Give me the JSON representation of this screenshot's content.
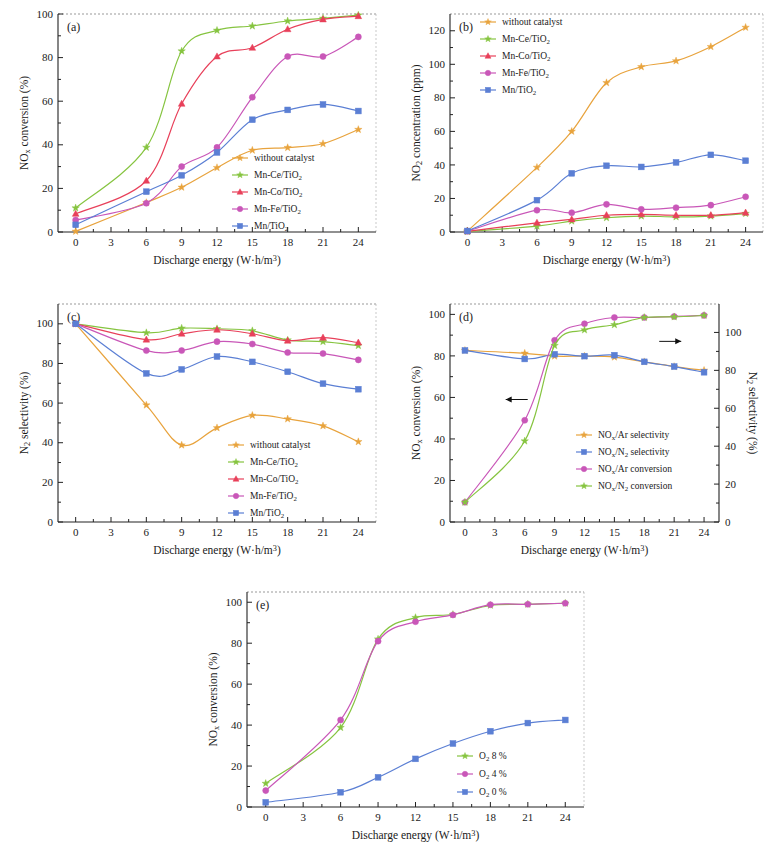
{
  "figure": {
    "x_axis_label": "Discharge energy (W·h/m³)",
    "x_ticks": [
      0,
      3,
      6,
      9,
      12,
      15,
      18,
      21,
      24
    ],
    "colors": {
      "without_catalyst": "#E8A33D",
      "mn_ce_tio2": "#86C440",
      "mn_co_tio2": "#E8405A",
      "mn_fe_tio2": "#C957B8",
      "mn_tio2": "#5B7FD4",
      "nox_ar_selectivity": "#E8A33D",
      "nox_n2_selectivity": "#5B7FD4",
      "nox_ar_conversion": "#C957B8",
      "nox_n2_conversion": "#86C440",
      "o2_8": "#86C440",
      "o2_4": "#C957B8",
      "o2_0": "#5B7FD4"
    }
  },
  "chart_data": [
    {
      "panel": "(a)",
      "type": "line",
      "title": "",
      "xlabel": "Discharge energy (W·h/m³)",
      "ylabel": "NOx conversion (%)",
      "ylabel_main": "NO",
      "ylabel_sub": "x",
      "ylabel_rest": " conversion (%)",
      "xlim": [
        -1.5,
        25.5
      ],
      "ylim": [
        0,
        100
      ],
      "y_ticks": [
        0,
        20,
        40,
        60,
        80,
        100
      ],
      "x": [
        0,
        6,
        9,
        12,
        15,
        18,
        21,
        24
      ],
      "grid": false,
      "legend_position": "bottom-right",
      "series": [
        {
          "name": "without catalyst",
          "color_key": "without_catalyst",
          "marker": "star",
          "values": [
            0.3,
            13.5,
            20.5,
            29.5,
            37.5,
            38.7,
            40.5,
            47.0
          ]
        },
        {
          "name": "Mn-Ce/TiO2",
          "label_main": "Mn-Ce/TiO",
          "label_sub": "2",
          "color_key": "mn_ce_tio2",
          "marker": "star",
          "values": [
            11.0,
            38.8,
            83.0,
            92.5,
            94.5,
            96.8,
            98.0,
            99.5
          ]
        },
        {
          "name": "Mn-Co/TiO2",
          "label_main": "Mn-Co/TiO",
          "label_sub": "2",
          "color_key": "mn_co_tio2",
          "marker": "triangle",
          "values": [
            8.3,
            23.5,
            58.8,
            80.5,
            84.5,
            93.0,
            97.5,
            99.0
          ]
        },
        {
          "name": "Mn-Fe/TiO2",
          "label_main": "Mn-Fe/TiO",
          "label_sub": "2",
          "color_key": "mn_fe_tio2",
          "marker": "circle",
          "values": [
            5.5,
            13.2,
            30.0,
            38.8,
            61.8,
            80.5,
            80.5,
            89.5
          ]
        },
        {
          "name": "Mn/TiO2",
          "label_main": "Mn/TiO",
          "label_sub": "2",
          "color_key": "mn_tio2",
          "marker": "square",
          "values": [
            3.3,
            18.5,
            26.0,
            36.5,
            51.5,
            56.0,
            58.5,
            55.5
          ]
        }
      ]
    },
    {
      "panel": "(b)",
      "type": "line",
      "title": "",
      "xlabel": "Discharge energy (W·h/m³)",
      "ylabel": "NO2 concentration (ppm)",
      "ylabel_main": "NO",
      "ylabel_sub": "2",
      "ylabel_rest": " concentration (ppm)",
      "xlim": [
        -1.5,
        25.5
      ],
      "ylim": [
        0,
        130
      ],
      "y_ticks": [
        0,
        20,
        40,
        60,
        80,
        100,
        120
      ],
      "x": [
        0,
        6,
        9,
        12,
        15,
        18,
        21,
        24
      ],
      "grid": false,
      "legend_position": "top-left",
      "series": [
        {
          "name": "without catalyst",
          "color_key": "without_catalyst",
          "marker": "star",
          "values": [
            0.5,
            38.5,
            60.0,
            89.0,
            98.5,
            102.0,
            110.5,
            122.0
          ]
        },
        {
          "name": "Mn-Ce/TiO2",
          "label_main": "Mn-Ce/TiO",
          "label_sub": "2",
          "color_key": "mn_ce_tio2",
          "marker": "star",
          "values": [
            0.3,
            3.5,
            6.5,
            8.5,
            9.5,
            9.0,
            9.5,
            11.0
          ]
        },
        {
          "name": "Mn-Co/TiO2",
          "label_main": "Mn-Co/TiO",
          "label_sub": "2",
          "color_key": "mn_co_tio2",
          "marker": "triangle",
          "values": [
            0.4,
            5.5,
            7.5,
            10.0,
            10.5,
            10.0,
            10.0,
            11.5
          ]
        },
        {
          "name": "Mn-Fe/TiO2",
          "label_main": "Mn-Fe/TiO",
          "label_sub": "2",
          "color_key": "mn_fe_tio2",
          "marker": "circle",
          "values": [
            0.5,
            13.0,
            11.5,
            16.5,
            13.5,
            14.5,
            16.0,
            21.0
          ]
        },
        {
          "name": "Mn/TiO2",
          "label_main": "Mn/TiO",
          "label_sub": "2",
          "color_key": "mn_tio2",
          "marker": "square",
          "values": [
            0.6,
            19.0,
            35.0,
            39.5,
            38.8,
            41.5,
            46.0,
            42.5
          ]
        }
      ]
    },
    {
      "panel": "(c)",
      "type": "line",
      "title": "",
      "xlabel": "Discharge energy (W·h/m³)",
      "ylabel": "N2 selectivity (%)",
      "ylabel_main": "N",
      "ylabel_sub": "2",
      "ylabel_rest": " selectivity (%)",
      "xlim": [
        -1.5,
        25.5
      ],
      "ylim": [
        0,
        110
      ],
      "y_ticks": [
        0,
        20,
        40,
        60,
        80,
        100
      ],
      "x": [
        0,
        6,
        9,
        12,
        15,
        18,
        21,
        24
      ],
      "grid": false,
      "legend_position": "bottom-right",
      "series": [
        {
          "name": "without catalyst",
          "color_key": "without_catalyst",
          "marker": "star",
          "values": [
            100.0,
            59.0,
            38.8,
            47.5,
            53.8,
            52.0,
            48.5,
            40.5
          ]
        },
        {
          "name": "Mn-Ce/TiO2",
          "label_main": "Mn-Ce/TiO",
          "label_sub": "2",
          "color_key": "mn_ce_tio2",
          "marker": "star",
          "values": [
            100.0,
            95.5,
            97.8,
            97.5,
            96.5,
            91.8,
            91.0,
            89.0
          ]
        },
        {
          "name": "Mn-Co/TiO2",
          "label_main": "Mn-Co/TiO",
          "label_sub": "2",
          "color_key": "mn_co_tio2",
          "marker": "triangle",
          "values": [
            100.0,
            92.0,
            95.0,
            97.0,
            95.0,
            91.5,
            93.0,
            90.5
          ]
        },
        {
          "name": "Mn-Fe/TiO2",
          "label_main": "Mn-Fe/TiO",
          "label_sub": "2",
          "color_key": "mn_fe_tio2",
          "marker": "circle",
          "values": [
            100.0,
            86.5,
            86.5,
            91.0,
            89.8,
            85.5,
            85.0,
            81.8
          ]
        },
        {
          "name": "Mn/TiO2",
          "label_main": "Mn/TiO",
          "label_sub": "2",
          "color_key": "mn_tio2",
          "marker": "square",
          "values": [
            100.0,
            75.0,
            77.0,
            83.5,
            80.8,
            75.8,
            69.8,
            67.0
          ]
        }
      ]
    },
    {
      "panel": "(d)",
      "type": "line",
      "title": "",
      "xlabel": "Discharge energy (W·h/m³)",
      "ylabel": "NOx conversion (%)",
      "ylabel_main": "NO",
      "ylabel_sub": "x",
      "ylabel_rest": " conversion (%)",
      "ylabel_right": "N2 selectivity (%)",
      "ylabel_right_main": "N",
      "ylabel_right_sub": "2",
      "ylabel_right_rest": " selectivity (%)",
      "xlim": [
        -1.5,
        25.5
      ],
      "ylim": [
        0,
        105
      ],
      "ylim_right": [
        0,
        115
      ],
      "y_ticks": [
        0,
        20,
        40,
        60,
        80,
        100
      ],
      "y_ticks_right": [
        0,
        20,
        40,
        60,
        80,
        100
      ],
      "x": [
        0,
        6,
        9,
        12,
        15,
        18,
        21,
        24
      ],
      "grid": false,
      "legend_position": "center-right",
      "annotations": [
        {
          "name": "left-arrow",
          "x": 6.3,
          "y": 59,
          "direction": "left"
        },
        {
          "name": "right-arrow",
          "x": 19.5,
          "y": 87,
          "direction": "right"
        }
      ],
      "series": [
        {
          "name": "NOx/Ar selectivity",
          "label_main": "NO",
          "label_sub": "x",
          "label_rest": "/Ar selectivity",
          "color_key": "nox_ar_selectivity",
          "marker": "star",
          "axis": "right",
          "values": [
            90.5,
            89.0,
            87.5,
            87.5,
            87.0,
            84.5,
            82.0,
            80.0
          ]
        },
        {
          "name": "NOx/N2 selectivity",
          "label_main": "NO",
          "label_sub": "x",
          "label_rest": "/N",
          "label_sub2": "2",
          "label_rest2": " selectivity",
          "color_key": "nox_n2_selectivity",
          "marker": "square",
          "axis": "right",
          "values": [
            90.5,
            86.0,
            88.5,
            87.5,
            88.0,
            84.5,
            82.0,
            79.0
          ]
        },
        {
          "name": "NOx/Ar conversion",
          "label_main": "NO",
          "label_sub": "x",
          "label_rest": "/Ar conversion",
          "color_key": "nox_ar_conversion",
          "marker": "circle",
          "axis": "left",
          "values": [
            9.5,
            49.0,
            87.5,
            95.5,
            98.5,
            98.5,
            99.0,
            99.5
          ]
        },
        {
          "name": "NOx/N2 conversion",
          "label_main": "NO",
          "label_sub": "x",
          "label_rest": "/N",
          "label_sub2": "2",
          "label_rest2": " conversion",
          "color_key": "nox_n2_conversion",
          "marker": "star",
          "axis": "left",
          "values": [
            9.5,
            39.0,
            85.0,
            92.5,
            95.0,
            98.5,
            98.8,
            99.5
          ]
        }
      ]
    },
    {
      "panel": "(e)",
      "type": "line",
      "title": "",
      "xlabel": "Discharge energy (W·h/m³)",
      "ylabel": "NOx conversion (%)",
      "ylabel_main": "NO",
      "ylabel_sub": "x",
      "ylabel_rest": " conversion (%)",
      "xlim": [
        -1.5,
        25.5
      ],
      "ylim": [
        0,
        105
      ],
      "y_ticks": [
        0,
        20,
        40,
        60,
        80,
        100
      ],
      "x": [
        0,
        6,
        9,
        12,
        15,
        18,
        21,
        24
      ],
      "grid": false,
      "legend_position": "bottom-right",
      "series": [
        {
          "name": "O2 8 %",
          "label_main": "O",
          "label_sub": "2",
          "label_rest": " 8 %",
          "color_key": "o2_8",
          "marker": "star",
          "values": [
            11.5,
            38.8,
            82.0,
            92.5,
            94.0,
            98.5,
            99.0,
            99.5
          ]
        },
        {
          "name": "O2 4 %",
          "label_main": "O",
          "label_sub": "2",
          "label_rest": " 4 %",
          "color_key": "o2_4",
          "marker": "circle",
          "values": [
            8.0,
            42.5,
            81.0,
            90.5,
            93.8,
            98.8,
            99.0,
            99.5
          ]
        },
        {
          "name": "O2 0 %",
          "label_main": "O",
          "label_sub": "2",
          "label_rest": " 0 %",
          "color_key": "o2_0",
          "marker": "square",
          "values": [
            2.3,
            7.2,
            14.5,
            23.5,
            31.0,
            37.0,
            41.0,
            42.5
          ]
        }
      ]
    }
  ]
}
